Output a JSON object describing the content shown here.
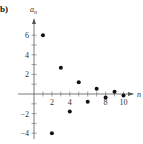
{
  "panel_label": "b)",
  "chart_data": {
    "type": "scatter",
    "title": "",
    "xlabel": "n",
    "ylabel": "a_n",
    "xlim": [
      0,
      10.8
    ],
    "ylim": [
      -4.6,
      7
    ],
    "grid": false,
    "x_ticks": [
      2,
      4,
      8,
      10
    ],
    "y_ticks": [
      6,
      4,
      2,
      -2,
      -4
    ],
    "x": [
      1,
      2,
      3,
      4,
      5,
      6,
      7,
      8,
      9,
      10
    ],
    "y": [
      6,
      -4,
      2.67,
      -1.78,
      1.19,
      -0.79,
      0.53,
      -0.35,
      0.23,
      -0.16
    ],
    "marker_color": "#111111"
  },
  "axis_labels": {
    "y_main": "a",
    "y_sub": "n",
    "x": "n"
  }
}
